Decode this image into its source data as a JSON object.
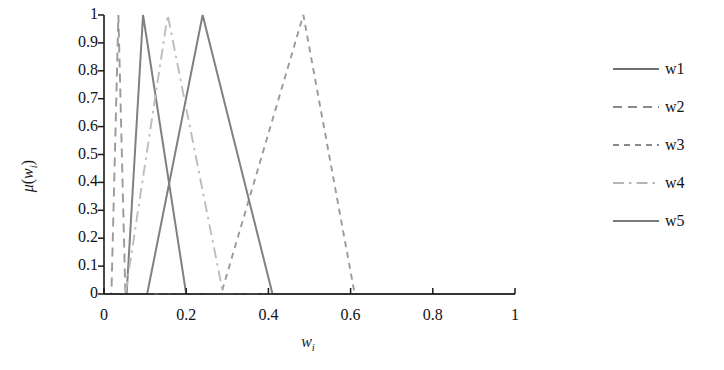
{
  "chart_data": {
    "type": "line",
    "title": "",
    "subtitle": "",
    "xlabel": "w_i",
    "ylabel": "mu(w_i)",
    "xlim": [
      0,
      1
    ],
    "ylim": [
      0,
      1
    ],
    "grid": false,
    "legend_position": "right",
    "xticks": [
      "0",
      "0.2",
      "0.4",
      "0.6",
      "0.8",
      "1"
    ],
    "xtick_values": [
      0,
      0.2,
      0.4,
      0.6,
      0.8,
      1
    ],
    "yticks": [
      "0",
      "0.1",
      "0.2",
      "0.3",
      "0.4",
      "0.5",
      "0.6",
      "0.7",
      "0.8",
      "0.9",
      "1"
    ],
    "ytick_values": [
      0,
      0.1,
      0.2,
      0.3,
      0.4,
      0.5,
      0.6,
      0.7,
      0.8,
      0.9,
      1
    ],
    "series": [
      {
        "name": "w1",
        "style": "solid",
        "color": "#808080",
        "points": [
          [
            0.0,
            0.0
          ],
          [
            0.055,
            0.0
          ],
          [
            0.095,
            1.0
          ],
          [
            0.2,
            0.0
          ],
          [
            1.0,
            0.0
          ]
        ],
        "triangle": {
          "left": 0.055,
          "peak": 0.095,
          "right": 0.2
        }
      },
      {
        "name": "w2",
        "style": "dashed",
        "color": "#9a9a9a",
        "points": [
          [
            0.0,
            0.0
          ],
          [
            0.018,
            0.0
          ],
          [
            0.035,
            1.0
          ],
          [
            0.052,
            0.0
          ],
          [
            1.0,
            0.0
          ]
        ],
        "triangle": {
          "left": 0.018,
          "peak": 0.035,
          "right": 0.052
        }
      },
      {
        "name": "w3",
        "style": "dashed-short",
        "color": "#9a9a9a",
        "points": [
          [
            0.0,
            0.0
          ],
          [
            0.285,
            0.0
          ],
          [
            0.485,
            1.0
          ],
          [
            0.61,
            0.0
          ],
          [
            1.0,
            0.0
          ]
        ],
        "triangle": {
          "left": 0.285,
          "peak": 0.485,
          "right": 0.61
        }
      },
      {
        "name": "w4",
        "style": "dash-dot",
        "color": "#bdbdbd",
        "points": [
          [
            0.0,
            0.0
          ],
          [
            0.052,
            0.0
          ],
          [
            0.155,
            1.0
          ],
          [
            0.29,
            0.0
          ],
          [
            1.0,
            0.0
          ]
        ],
        "triangle": {
          "left": 0.052,
          "peak": 0.155,
          "right": 0.29
        }
      },
      {
        "name": "w5",
        "style": "solid",
        "color": "#808080",
        "points": [
          [
            0.0,
            0.0
          ],
          [
            0.105,
            0.0
          ],
          [
            0.24,
            1.0
          ],
          [
            0.41,
            0.0
          ],
          [
            1.0,
            0.0
          ]
        ],
        "triangle": {
          "left": 0.105,
          "peak": 0.24,
          "right": 0.41
        }
      }
    ]
  },
  "axes": {
    "y_label_text": "μ(w",
    "y_label_sub": "i",
    "y_label_close": ")",
    "x_label_text": "w",
    "x_label_sub": "i"
  },
  "legend": {
    "items": [
      {
        "label": "w1",
        "style": "solid",
        "color": "#6e6e6e"
      },
      {
        "label": "w2",
        "style": "dashed",
        "color": "#8a8a8a"
      },
      {
        "label": "w3",
        "style": "dashed-short",
        "color": "#8a8a8a"
      },
      {
        "label": "w4",
        "style": "dash-dot",
        "color": "#b5b5b5"
      },
      {
        "label": "w5",
        "style": "solid",
        "color": "#7a7a7a"
      }
    ]
  },
  "colors": {
    "axis": "#1a1a1a",
    "background": "#ffffff",
    "solid_line": "#808080",
    "dashed_line": "#9a9a9a",
    "light_line": "#bdbdbd"
  }
}
